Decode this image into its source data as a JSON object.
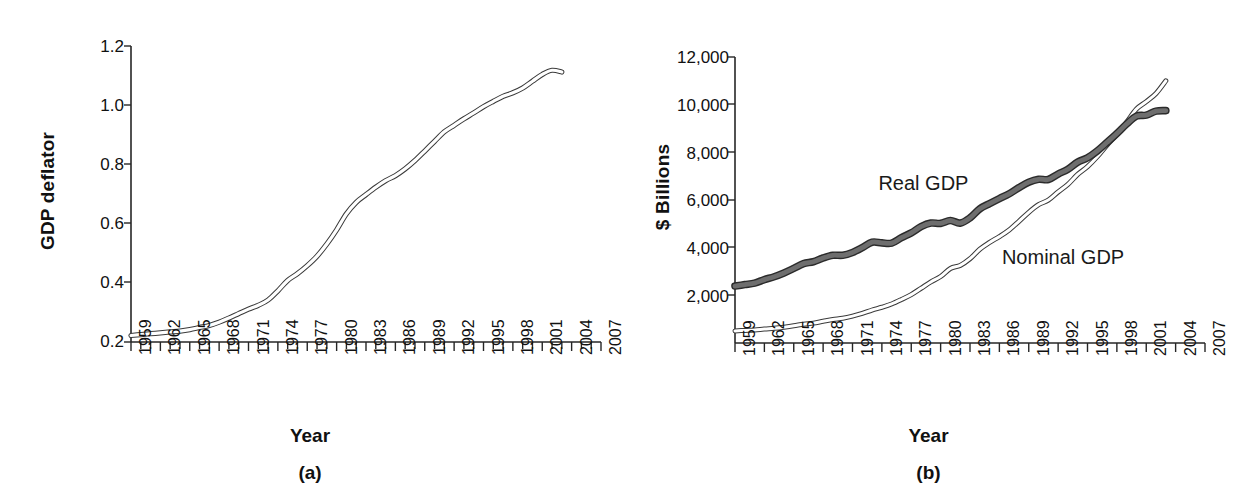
{
  "figure": {
    "panels": [
      {
        "id": "a",
        "caption": "(a)",
        "xlabel": "Year",
        "ylabel": "GDP deflator"
      },
      {
        "id": "b",
        "caption": "(b)",
        "xlabel": "Year",
        "ylabel": "$ Billions"
      }
    ]
  },
  "chart_data": [
    {
      "type": "line",
      "panel": "a",
      "title": "",
      "xlabel": "Year",
      "ylabel": "GDP deflator",
      "xlim": [
        1959,
        2007
      ],
      "ylim": [
        0.2,
        1.2
      ],
      "ytick_labels": [
        "1.2",
        "1.0",
        "0.8",
        "0.6",
        "0.4",
        "0.2"
      ],
      "ytick_values": [
        1.2,
        1.0,
        0.8,
        0.6,
        0.4,
        0.2
      ],
      "xtick_labels": [
        "1959",
        "1962",
        "1965",
        "1968",
        "1971",
        "1974",
        "1977",
        "1980",
        "1983",
        "1986",
        "1989",
        "1992",
        "1995",
        "1998",
        "2001",
        "2004",
        "2007"
      ],
      "xtick_values": [
        1959,
        1962,
        1965,
        1968,
        1971,
        1974,
        1977,
        1980,
        1983,
        1986,
        1989,
        1992,
        1995,
        1998,
        2001,
        2004,
        2007
      ],
      "minor_xticks_every": 1,
      "grid": false,
      "legend": "none",
      "line_style": "hollow-outlined-band",
      "series": [
        {
          "name": "GDP deflator",
          "x": [
            1959,
            1960,
            1961,
            1962,
            1963,
            1964,
            1965,
            1966,
            1967,
            1968,
            1969,
            1970,
            1971,
            1972,
            1973,
            1974,
            1975,
            1976,
            1977,
            1978,
            1979,
            1980,
            1981,
            1982,
            1983,
            1984,
            1985,
            1986,
            1987,
            1988,
            1989,
            1990,
            1991,
            1992,
            1993,
            1994,
            1995,
            1996,
            1997,
            1998,
            1999,
            2000,
            2001,
            2002,
            2003
          ],
          "values": [
            0.222,
            0.225,
            0.228,
            0.231,
            0.234,
            0.237,
            0.242,
            0.249,
            0.256,
            0.267,
            0.281,
            0.296,
            0.311,
            0.324,
            0.342,
            0.373,
            0.408,
            0.431,
            0.458,
            0.49,
            0.531,
            0.579,
            0.633,
            0.672,
            0.698,
            0.723,
            0.745,
            0.762,
            0.785,
            0.813,
            0.845,
            0.878,
            0.91,
            0.932,
            0.954,
            0.974,
            0.995,
            1.013,
            1.03,
            1.042,
            1.058,
            1.081,
            1.104,
            1.118,
            1.112
          ]
        }
      ]
    },
    {
      "type": "line",
      "panel": "b",
      "title": "",
      "xlabel": "Year",
      "ylabel": "$ Billions",
      "xlim": [
        1959,
        2007
      ],
      "ylim": [
        0,
        12000
      ],
      "ytick_labels": [
        "12,000",
        "10,000",
        "8,000",
        "6,000",
        "4,000",
        "2,000"
      ],
      "ytick_values": [
        12000,
        10000,
        8000,
        6000,
        4000,
        2000
      ],
      "xtick_labels": [
        "1959",
        "1962",
        "1965",
        "1968",
        "1971",
        "1974",
        "1977",
        "1980",
        "1983",
        "1986",
        "1989",
        "1992",
        "1995",
        "1998",
        "2001",
        "2004",
        "2007"
      ],
      "xtick_values": [
        1959,
        1962,
        1965,
        1968,
        1971,
        1974,
        1977,
        1980,
        1983,
        1986,
        1989,
        1992,
        1995,
        1998,
        2001,
        2004,
        2007
      ],
      "grid": false,
      "legend": "inline-annotations",
      "annotations": [
        {
          "text": "Real GDP",
          "x": 1981,
          "y": 6600
        },
        {
          "text": "Nominal GDP",
          "x": 1993,
          "y": 3500
        }
      ],
      "series": [
        {
          "name": "Real GDP",
          "style": "thick-filled-dark",
          "x": [
            1959,
            1960,
            1961,
            1962,
            1963,
            1964,
            1965,
            1966,
            1967,
            1968,
            1969,
            1970,
            1971,
            1972,
            1973,
            1974,
            1975,
            1976,
            1977,
            1978,
            1979,
            1980,
            1981,
            1982,
            1983,
            1984,
            1985,
            1986,
            1987,
            1988,
            1989,
            1990,
            1991,
            1992,
            1993,
            1994,
            1995,
            1996,
            1997,
            1998,
            1999,
            2000,
            2001,
            2002,
            2003
          ],
          "values": [
            2390,
            2450,
            2510,
            2660,
            2780,
            2940,
            3130,
            3330,
            3410,
            3570,
            3680,
            3680,
            3800,
            4000,
            4230,
            4200,
            4190,
            4420,
            4620,
            4880,
            5030,
            5020,
            5140,
            5030,
            5250,
            5630,
            5850,
            6060,
            6260,
            6520,
            6750,
            6870,
            6860,
            7090,
            7290,
            7590,
            7770,
            8060,
            8420,
            8790,
            9190,
            9520,
            9560,
            9730,
            9750
          ]
        },
        {
          "name": "Nominal GDP",
          "style": "hollow-outlined-band",
          "x": [
            1959,
            1960,
            1961,
            1962,
            1963,
            1964,
            1965,
            1966,
            1967,
            1968,
            1969,
            1970,
            1971,
            1972,
            1973,
            1974,
            1975,
            1976,
            1977,
            1978,
            1979,
            1980,
            1981,
            1982,
            1983,
            1984,
            1985,
            1986,
            1987,
            1988,
            1989,
            1990,
            1991,
            1992,
            1993,
            1994,
            1995,
            1996,
            1997,
            1998,
            1999,
            2000,
            2001,
            2002,
            2003
          ],
          "values": [
            507,
            527,
            545,
            586,
            618,
            664,
            720,
            790,
            834,
            911,
            985,
            1039,
            1128,
            1241,
            1383,
            1500,
            1638,
            1825,
            2031,
            2295,
            2563,
            2790,
            3128,
            3255,
            3537,
            3933,
            4220,
            4463,
            4740,
            5104,
            5484,
            5803,
            5996,
            6338,
            6657,
            7072,
            7398,
            7817,
            8304,
            8747,
            9268,
            9817,
            10128,
            10470,
            11000
          ]
        }
      ]
    }
  ]
}
